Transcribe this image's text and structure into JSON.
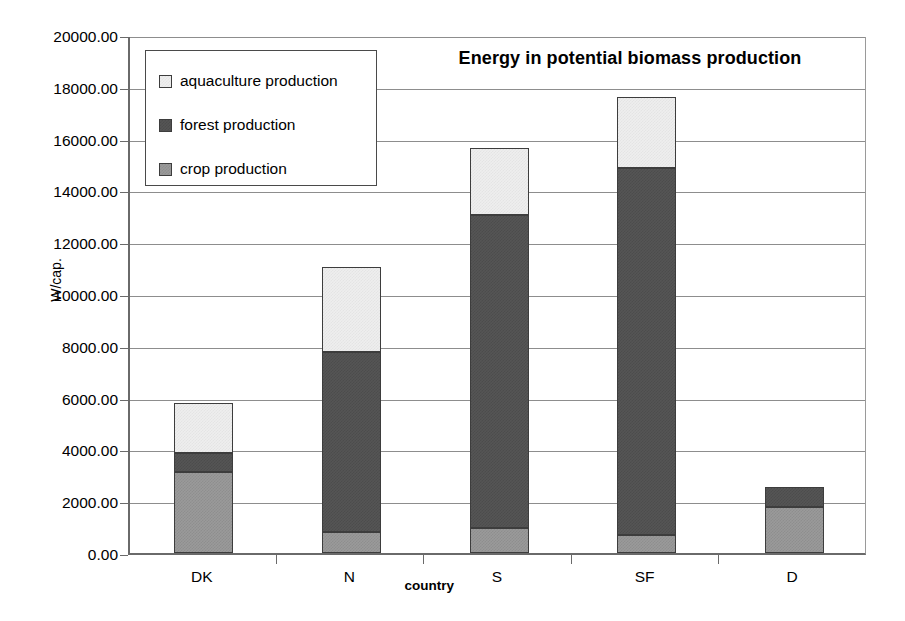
{
  "chart_data": {
    "type": "bar",
    "subtype": "stacked-vertical",
    "title": "Energy in potential biomass production",
    "xlabel": "country",
    "ylabel": "W/cap.",
    "categories": [
      "DK",
      "N",
      "S",
      "SF",
      "D"
    ],
    "ylim": [
      0,
      20000
    ],
    "ytick_step": 2000,
    "ytick_labels": [
      "0.00",
      "2000.00",
      "4000.00",
      "6000.00",
      "8000.00",
      "10000.00",
      "12000.00",
      "14000.00",
      "16000.00",
      "18000.00",
      "20000.00"
    ],
    "ytick_values": [
      0,
      2000,
      4000,
      6000,
      8000,
      10000,
      12000,
      14000,
      16000,
      18000,
      20000
    ],
    "grid": "horizontal",
    "legend_position": "upper-left-inside",
    "stack_order_bottom_to_top": [
      "crop production",
      "forest production",
      "aquaculture production"
    ],
    "series": [
      {
        "name": "crop production",
        "color": "#9a9a9a",
        "values": [
          3120,
          800,
          960,
          700,
          1780
        ]
      },
      {
        "name": "forest production",
        "color": "#555555",
        "values": [
          750,
          6950,
          12090,
          14150,
          770
        ]
      },
      {
        "name": "aquaculture production",
        "color": "#eeeeee",
        "values": [
          1930,
          3300,
          2600,
          2750,
          0
        ]
      }
    ],
    "totals": [
      5800,
      11050,
      15650,
      17600,
      2550
    ]
  },
  "legend": {
    "items": [
      {
        "label": "aquaculture production",
        "color": "#eeeeee"
      },
      {
        "label": "forest production",
        "color": "#555555"
      },
      {
        "label": "crop production",
        "color": "#9a9a9a"
      }
    ]
  }
}
